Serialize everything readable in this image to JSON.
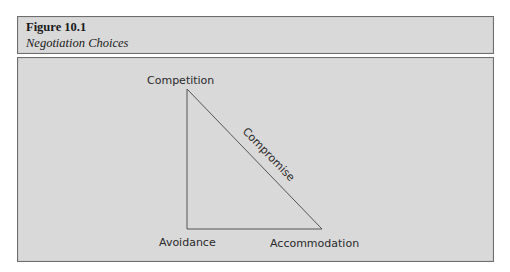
{
  "figure": {
    "number": "Figure 10.1",
    "title": "Negotiation Choices"
  },
  "diagram": {
    "type": "triangle",
    "vertices": {
      "top": "Competition",
      "bottom_left": "Avoidance",
      "bottom_right": "Accommodation"
    },
    "hypotenuse_label": "Compromise",
    "colors": {
      "background": "#d9d9d9",
      "line": "#555555",
      "text": "#2a2a2a"
    }
  }
}
